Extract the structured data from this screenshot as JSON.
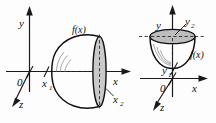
{
  "figure": {
    "background_color": "#fdfdfd",
    "ink_color": "#111111",
    "shade_color": "#c9c9c9",
    "panels": [
      {
        "id": "left",
        "name": "revolution-about-x-axis",
        "description": "Paraboloid generated by revolving f(x) about the x-axis, bounded between x1 and x2",
        "origin_label": "0",
        "axes": [
          {
            "name": "y-axis",
            "label": "y"
          },
          {
            "name": "x-axis",
            "label": "x"
          },
          {
            "name": "z-axis",
            "label": "z"
          }
        ],
        "curve_label": "f(x)",
        "bound_lower": "x",
        "bound_lower_sub": "1",
        "bound_upper": "x",
        "bound_upper_sub": "2"
      },
      {
        "id": "right",
        "name": "revolution-about-y-axis",
        "description": "Bowl-shaped paraboloid generated by revolving f(x) about the y-axis, bounded between y1 and y2",
        "origin_label": "0",
        "axes": [
          {
            "name": "y-axis",
            "label": "y"
          },
          {
            "name": "x-axis",
            "label": "x"
          },
          {
            "name": "z-axis",
            "label": "z"
          }
        ],
        "curve_label": "f(x)",
        "bound_lower": "y",
        "bound_lower_sub": "1",
        "bound_upper": "y",
        "bound_upper_sub": "2"
      }
    ]
  }
}
